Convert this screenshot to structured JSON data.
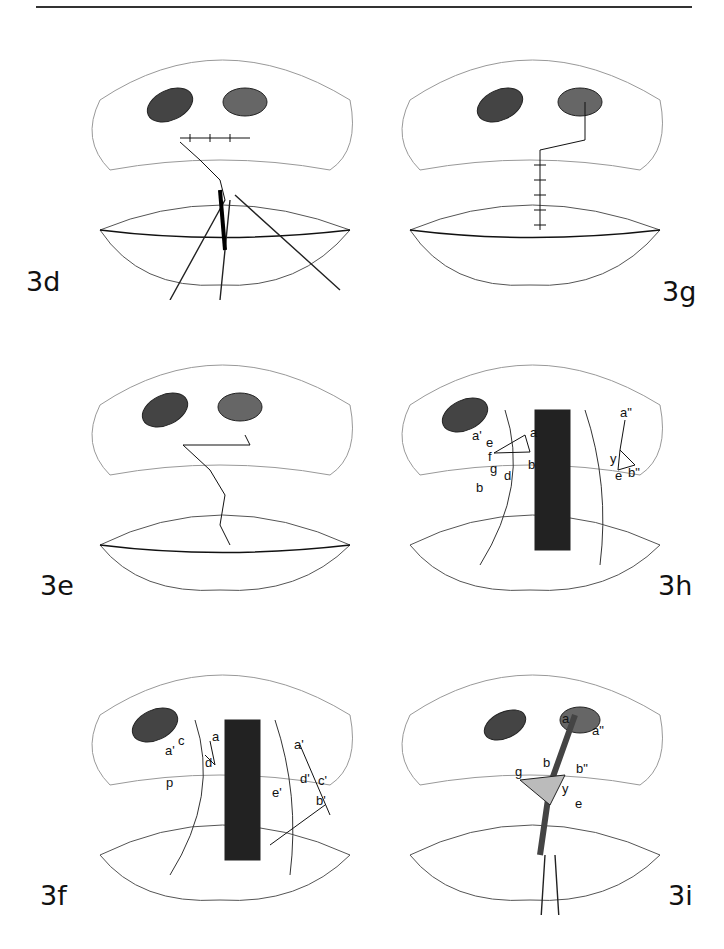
{
  "page": {
    "running_head": "Cleft Lip Repair"
  },
  "figures": [
    {
      "id": "3d",
      "label": "3d",
      "description": "Rotation-advancement closure with sutures; forceps and scissors inserted at vermilion"
    },
    {
      "id": "3g",
      "label": "3g",
      "description": "Completed repair with vertical suture line to vermilion"
    },
    {
      "id": "3e",
      "label": "3e",
      "description": "Zig-zag suture line closure across lip"
    },
    {
      "id": "3h",
      "label": "3h",
      "description": "Markings on cleft lip with labeled points",
      "points": [
        "a'",
        "e",
        "a",
        "f",
        "g",
        "b",
        "d",
        "b",
        "a\"",
        "y",
        "e",
        "b\""
      ]
    },
    {
      "id": "3f",
      "label": "3f",
      "description": "Markings on cleft lip with labeled points",
      "points": [
        "a'",
        "c",
        "a",
        "p",
        "d",
        "a'",
        "d'",
        "c'",
        "e'",
        "b'"
      ]
    },
    {
      "id": "3i",
      "label": "3i",
      "description": "Incision with forceps; labeled points",
      "points": [
        "a",
        "a\"",
        "b",
        "b\"",
        "g",
        "y",
        "e"
      ]
    }
  ]
}
